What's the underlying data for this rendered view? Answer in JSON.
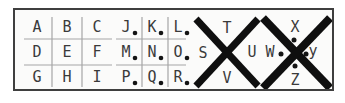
{
  "key": {
    "title": "pigpen-cipher-key",
    "grids": [
      {
        "id": "grid-abc",
        "dotted": false,
        "rows": [
          [
            "A",
            "B",
            "C"
          ],
          [
            "D",
            "E",
            "F"
          ],
          [
            "G",
            "H",
            "I"
          ]
        ]
      },
      {
        "id": "grid-jkl-dotted",
        "dotted": true,
        "rows": [
          [
            "J",
            "K",
            "L"
          ],
          [
            "M",
            "N",
            "O"
          ],
          [
            "P",
            "Q",
            "R"
          ]
        ]
      }
    ],
    "crosses": [
      {
        "id": "cross-stuv",
        "dotted": false,
        "top": "T",
        "left": "S",
        "right": "U",
        "bottom": "V"
      },
      {
        "id": "cross-wxyz",
        "dotted": true,
        "top": "X",
        "left": "W",
        "right": "y",
        "bottom": "Z"
      }
    ]
  },
  "colors": {
    "page_background": "#ffffff",
    "panel_background": "#fbfbfa",
    "panel_border": "#3f3f3f",
    "grid_line": "#a6a6a6",
    "letter": "#3a3a3a",
    "cross_stroke": "#0f0f0f",
    "dot": "#141414"
  }
}
